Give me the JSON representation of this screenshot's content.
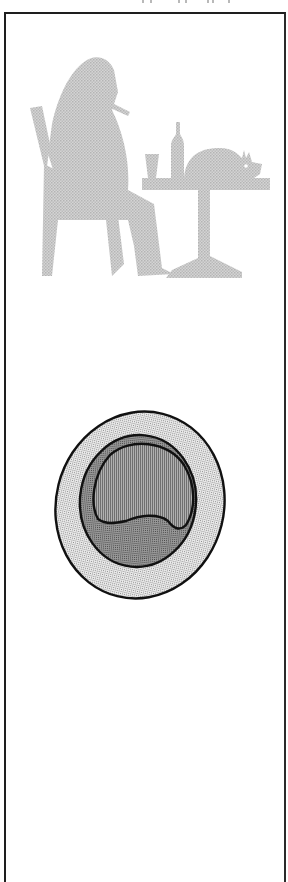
{
  "page": {
    "top_fragment_text": "",
    "top_fragment_note": "illegible cut-off text at top edge"
  },
  "figures": [
    {
      "id": "cafe-silhouette",
      "description": "Halftone gray silhouette of a seated man smoking a cigar at a café table with a glass, a bottle and a small pig",
      "elements": [
        "chair",
        "seated-man",
        "cigar",
        "table",
        "glass",
        "bottle",
        "pig"
      ],
      "fill_color": "#c8c8c8"
    },
    {
      "id": "schematic-oval",
      "description": "Schematic oval: dotted outer ring, cross-hatched inner disc, vertically hatched blob with wavy lower edge",
      "layers": [
        "outer-ring-dotted",
        "inner-disc-crosshatched",
        "blob-vertical-hatch"
      ],
      "stroke_color": "#111111"
    }
  ],
  "colors": {
    "frame": "#1e1e1e",
    "silhouette": "#c8c8c8",
    "background": "#ffffff",
    "ink": "#111111"
  }
}
